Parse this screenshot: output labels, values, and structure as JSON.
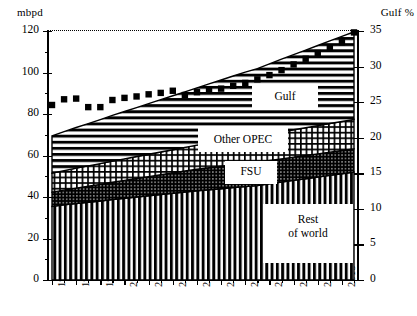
{
  "axes": {
    "y_left_title": "mbpd",
    "y_right_title": "Gulf %",
    "y_left_ticks": [
      "120",
      "100",
      "80",
      "60",
      "40",
      "20",
      "0"
    ],
    "y_right_ticks": [
      "35",
      "30",
      "25",
      "20",
      "15",
      "10",
      "5",
      "0"
    ],
    "x_ticks": [
      "1995",
      "1997",
      "1999",
      "2001",
      "2003",
      "2005",
      "2007",
      "2009",
      "2011",
      "2013",
      "2015",
      "2017",
      "2019"
    ]
  },
  "series_labels": {
    "gulf": "Gulf",
    "other_opec": "Other OPEC",
    "fsu": "FSU",
    "rest_of_world_line1": "Rest",
    "rest_of_world_line2": "of world"
  },
  "chart_data": {
    "type": "area",
    "title": "",
    "xlabel": "",
    "ylabel": "mbpd",
    "y2label": "Gulf %",
    "ylim": [
      0,
      120
    ],
    "y2lim": [
      0,
      35
    ],
    "grid": false,
    "legend": "inline-labels",
    "x": [
      1995,
      1996,
      1997,
      1998,
      1999,
      2000,
      2001,
      2002,
      2003,
      2004,
      2005,
      2006,
      2007,
      2008,
      2009,
      2010,
      2011,
      2012,
      2013,
      2014,
      2015,
      2016,
      2017,
      2018,
      2019,
      2020
    ],
    "categories": [
      "1995",
      "1996",
      "1997",
      "1998",
      "1999",
      "2000",
      "2001",
      "2002",
      "2003",
      "2004",
      "2005",
      "2006",
      "2007",
      "2008",
      "2009",
      "2010",
      "2011",
      "2012",
      "2013",
      "2014",
      "2015",
      "2016",
      "2017",
      "2018",
      "2019",
      "2020"
    ],
    "stacking": "stacked-from-bottom",
    "stack_order": [
      "Rest of world",
      "FSU",
      "Other OPEC",
      "Gulf"
    ],
    "series": [
      {
        "name": "Rest of world",
        "pattern": "vertical-lines",
        "values": [
          35.5,
          36.2,
          36.9,
          37.5,
          38.1,
          38.8,
          39.4,
          40.0,
          40.6,
          41.2,
          41.8,
          42.4,
          43.0,
          43.5,
          44.0,
          44.5,
          45.0,
          45.5,
          46.4,
          47.2,
          48.0,
          48.8,
          49.6,
          50.4,
          51.2,
          52.0
        ]
      },
      {
        "name": "FSU",
        "pattern": "dense-cross-hatch",
        "values": [
          6.8,
          7.1,
          7.4,
          7.7,
          8.0,
          8.3,
          8.6,
          8.9,
          9.2,
          9.5,
          9.8,
          10.1,
          10.4,
          10.6,
          10.8,
          11.0,
          11.2,
          11.2,
          11.2,
          11.2,
          11.2,
          11.2,
          11.2,
          11.2,
          11.2,
          11.2
        ]
      },
      {
        "name": "Other OPEC",
        "pattern": "grid-hatch",
        "values": [
          9.2,
          9.4,
          9.6,
          9.8,
          10.0,
          10.2,
          10.4,
          10.6,
          10.8,
          11.0,
          11.2,
          11.4,
          11.6,
          11.8,
          12.0,
          12.2,
          12.4,
          12.6,
          12.8,
          13.0,
          13.2,
          13.4,
          13.6,
          13.8,
          14.0,
          14.2
        ]
      },
      {
        "name": "Gulf",
        "pattern": "horizontal-lines",
        "values": [
          18.0,
          18.8,
          19.6,
          20.4,
          21.2,
          22.0,
          22.8,
          23.6,
          24.4,
          25.2,
          26.0,
          26.8,
          27.6,
          28.6,
          29.6,
          30.6,
          31.6,
          32.6,
          33.8,
          35.0,
          36.2,
          37.4,
          38.6,
          39.8,
          41.0,
          42.2
        ]
      }
    ],
    "total_supply": [
      69.5,
      71.5,
      73.5,
      75.4,
      77.3,
      79.3,
      81.2,
      83.1,
      85.0,
      86.9,
      88.8,
      90.7,
      92.6,
      94.5,
      96.4,
      98.3,
      100.2,
      101.9,
      104.2,
      106.4,
      108.6,
      110.8,
      113.0,
      115.2,
      117.4,
      119.6
    ],
    "secondary_series": {
      "name": "Gulf %",
      "type": "scatter",
      "marker": "filled-square",
      "axis": "right",
      "unit": "%",
      "values": [
        24.6,
        25.4,
        25.5,
        24.3,
        24.3,
        25.3,
        25.6,
        25.8,
        26.1,
        26.3,
        26.6,
        26.0,
        26.4,
        26.6,
        26.9,
        27.3,
        27.7,
        28.2,
        28.8,
        29.5,
        30.3,
        31.1,
        31.9,
        32.6,
        33.4,
        34.8
      ]
    }
  },
  "colors": {
    "ink": "#000000",
    "background": "#ffffff"
  }
}
